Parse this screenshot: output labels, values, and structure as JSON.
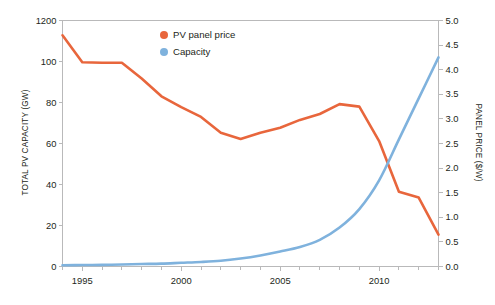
{
  "chart_data": {
    "type": "line",
    "title": "",
    "subtitle": "",
    "xlabel": "",
    "ylabel": "TOTAL PV CAPACITY (GW)",
    "y2label": "PANEL PRICE ($/W)",
    "grid": false,
    "legend_position": "top-center",
    "xlim": [
      1994,
      2013
    ],
    "x_ticks_major": [
      1995,
      2000,
      2005,
      2010
    ],
    "x_ticks_major_labels": [
      "1995",
      "2000",
      "2005",
      "2010"
    ],
    "x_ticks_minor": [
      1994,
      1996,
      1997,
      1998,
      1999,
      2001,
      2002,
      2003,
      2004,
      2006,
      2007,
      2008,
      2009,
      2011,
      2012,
      2013
    ],
    "ylim": [
      0,
      120
    ],
    "y_ticks": [
      0,
      20,
      40,
      60,
      80,
      100,
      1200
    ],
    "y_tick_labels": [
      "0",
      "20",
      "40",
      "60",
      "80",
      "100",
      "1200"
    ],
    "y2lim": [
      0.0,
      5.0
    ],
    "y2_ticks": [
      0.0,
      0.5,
      1.0,
      1.5,
      2.0,
      2.5,
      3.0,
      3.5,
      4.0,
      4.5,
      5.0
    ],
    "y2_tick_labels": [
      "0.0",
      "0.5",
      "1.0",
      "1.5",
      "2.0",
      "2.5",
      "3.0",
      "3.5",
      "4.0",
      "4.5",
      "5.0"
    ],
    "x": [
      1994,
      1995,
      1996,
      1997,
      1998,
      1999,
      2000,
      2001,
      2002,
      2003,
      2004,
      2005,
      2006,
      2007,
      2008,
      2009,
      2010,
      2011,
      2012,
      2013
    ],
    "series": [
      {
        "name": "PV panel price",
        "axis": "right",
        "unit": "$/W",
        "color": "#e8663c",
        "values": [
          4.7,
          4.15,
          4.14,
          4.14,
          3.82,
          3.46,
          3.24,
          3.04,
          2.72,
          2.59,
          2.72,
          2.82,
          2.98,
          3.1,
          3.3,
          3.25,
          2.55,
          1.52,
          1.4,
          0.65
        ]
      },
      {
        "name": "Capacity",
        "axis": "left",
        "unit": "GW",
        "color": "#7fb2dd",
        "values": [
          0.6,
          0.7,
          0.8,
          1.0,
          1.2,
          1.4,
          1.8,
          2.2,
          2.8,
          3.9,
          5.4,
          7.3,
          9.5,
          13.0,
          19.0,
          28.0,
          42.0,
          62.0,
          82.0,
          102.0
        ]
      }
    ]
  },
  "legend": {
    "items": [
      {
        "label": "PV panel price",
        "color": "#e8663c"
      },
      {
        "label": "Capacity",
        "color": "#7fb2dd"
      }
    ]
  },
  "axes": {
    "left_title": "TOTAL PV CAPACITY (GW)",
    "right_title": "PANEL PRICE ($/W)"
  }
}
